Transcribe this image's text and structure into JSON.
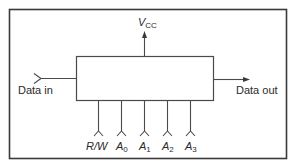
{
  "diagram": {
    "type": "block-diagram",
    "colors": {
      "line": "#4a4a4a",
      "frame": "#3a3a3a",
      "text": "#2a2a2a",
      "background": "#ffffff"
    },
    "power": {
      "label_main": "V",
      "label_sub": "CC",
      "direction": "up-arrow"
    },
    "data_in": {
      "label": "Data in",
      "connector": "fork-input"
    },
    "data_out": {
      "label": "Data out",
      "connector": "arrow-output"
    },
    "control_pins": [
      {
        "label_main": "R/W",
        "label_sub": ""
      },
      {
        "label_main": "A",
        "label_sub": "0"
      },
      {
        "label_main": "A",
        "label_sub": "1"
      },
      {
        "label_main": "A",
        "label_sub": "2"
      },
      {
        "label_main": "A",
        "label_sub": "3"
      }
    ]
  }
}
